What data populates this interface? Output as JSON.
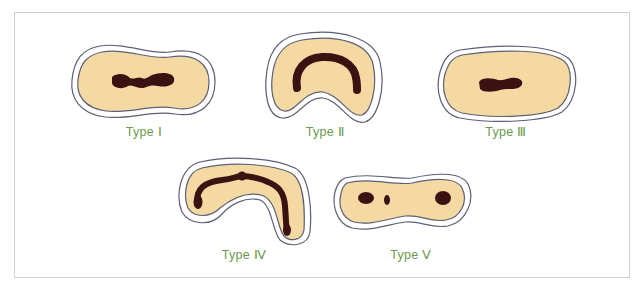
{
  "colors": {
    "fill": "#f5d9a3",
    "outline": "#5b5f78",
    "halo": "#ffffff",
    "blob": "#3a1212",
    "label": "#6b9a4c",
    "frame": "#cfcfcf"
  },
  "types": [
    {
      "id": "type-1",
      "label": "Type Ⅰ",
      "description": "two small central blobs connected by a thin bridge"
    },
    {
      "id": "type-2",
      "label": "Type Ⅱ",
      "description": "single thick arch band in kidney shape"
    },
    {
      "id": "type-3",
      "label": "Type Ⅲ",
      "description": "single small central blob"
    },
    {
      "id": "type-4",
      "label": "Type Ⅳ",
      "description": "long arch band with central node in hooked shape"
    },
    {
      "id": "type-5",
      "label": "Type Ⅴ",
      "description": "three separate blobs in peanut shape"
    }
  ]
}
